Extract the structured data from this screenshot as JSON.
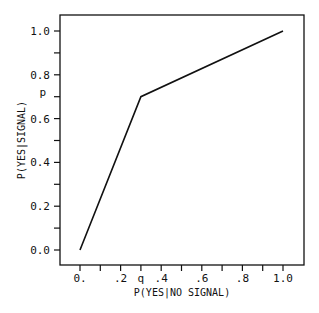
{
  "chart_data": {
    "type": "line",
    "title": "",
    "xlabel": "P(YES|NO SIGNAL)",
    "ylabel": "P(YES|SIGNAL)",
    "xlim": [
      0.0,
      1.0
    ],
    "ylim": [
      0.0,
      1.0
    ],
    "grid": false,
    "legend": null,
    "x_ticks": [
      0.0,
      0.1,
      0.2,
      0.3,
      0.4,
      0.5,
      0.6,
      0.7,
      0.8,
      0.9,
      1.0
    ],
    "x_tick_labels": [
      {
        "value": 0.0,
        "label": "0."
      },
      {
        "value": 0.2,
        "label": ".2"
      },
      {
        "value": 0.3,
        "label": "q"
      },
      {
        "value": 0.4,
        "label": ".4"
      },
      {
        "value": 0.6,
        "label": ".6"
      },
      {
        "value": 0.8,
        "label": ".8"
      },
      {
        "value": 1.0,
        "label": "1.0"
      }
    ],
    "y_ticks": [
      0.0,
      0.1,
      0.2,
      0.3,
      0.4,
      0.5,
      0.6,
      0.7,
      0.8,
      0.9,
      1.0
    ],
    "y_tick_labels": [
      {
        "value": 0.0,
        "label": "0.0"
      },
      {
        "value": 0.2,
        "label": "0.2"
      },
      {
        "value": 0.4,
        "label": "0.4"
      },
      {
        "value": 0.6,
        "label": "0.6"
      },
      {
        "value": 0.7,
        "label": "p"
      },
      {
        "value": 0.8,
        "label": "0.8"
      },
      {
        "value": 1.0,
        "label": "1.0"
      }
    ],
    "annotations": [
      {
        "text": "q",
        "axis": "x",
        "value": 0.3
      },
      {
        "text": "p",
        "axis": "y",
        "value": 0.7
      }
    ],
    "series": [
      {
        "name": "ROC",
        "x": [
          0.0,
          0.3,
          1.0
        ],
        "y": [
          0.0,
          0.7,
          1.0
        ],
        "color": "#111111"
      }
    ]
  }
}
